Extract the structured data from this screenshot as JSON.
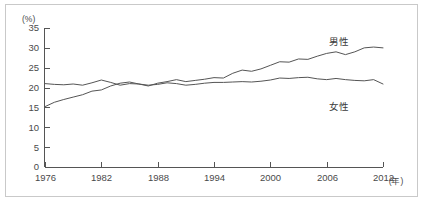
{
  "chart_data": {
    "type": "line",
    "title": "",
    "subtitle": "",
    "xlabel": "年",
    "ylabel": "(%)",
    "yunit": "(%)",
    "xunit": "(年)",
    "grid": false,
    "legend_position": "inline-labels",
    "xlim": [
      1976,
      2012
    ],
    "ylim": [
      0,
      35
    ],
    "ytick_labels": [
      "35",
      "30",
      "25",
      "20",
      "15",
      "10",
      "5",
      "0"
    ],
    "ytick_values": [
      35,
      30,
      25,
      20,
      15,
      10,
      5,
      0
    ],
    "xtick_labels": [
      "1976",
      "1982",
      "1988",
      "1994",
      "2000",
      "2006",
      "2012"
    ],
    "xtick_values": [
      1976,
      1982,
      1988,
      1994,
      2000,
      2006,
      2012
    ],
    "x": [
      1976,
      1977,
      1978,
      1979,
      1980,
      1981,
      1982,
      1983,
      1984,
      1985,
      1986,
      1987,
      1988,
      1989,
      1990,
      1991,
      1992,
      1993,
      1994,
      1995,
      1996,
      1997,
      1998,
      1999,
      2000,
      2001,
      2002,
      2003,
      2004,
      2005,
      2006,
      2007,
      2008,
      2009,
      2010,
      2011,
      2012
    ],
    "series": [
      {
        "name": "男性",
        "label": "男性",
        "color": "#555555",
        "values": [
          15.2,
          16.3,
          17.0,
          17.6,
          18.2,
          19.1,
          19.4,
          20.4,
          21.1,
          21.4,
          20.9,
          20.4,
          21.1,
          21.5,
          22.0,
          21.5,
          21.8,
          22.1,
          22.5,
          22.4,
          23.6,
          24.4,
          24.1,
          24.7,
          25.6,
          26.5,
          26.4,
          27.2,
          27.1,
          27.9,
          28.6,
          29.0,
          28.3,
          29.0,
          30.0,
          30.2,
          30.0
        ]
      },
      {
        "name": "女性",
        "label": "女性",
        "color": "#555555",
        "values": [
          21.0,
          20.8,
          20.7,
          20.9,
          20.6,
          21.2,
          21.9,
          21.3,
          20.6,
          21.0,
          20.9,
          20.6,
          20.8,
          21.2,
          21.0,
          20.6,
          20.8,
          21.1,
          21.3,
          21.3,
          21.4,
          21.5,
          21.4,
          21.6,
          21.9,
          22.4,
          22.3,
          22.5,
          22.6,
          22.2,
          22.0,
          22.3,
          22.0,
          21.8,
          21.7,
          22.0,
          20.9
        ]
      }
    ]
  }
}
